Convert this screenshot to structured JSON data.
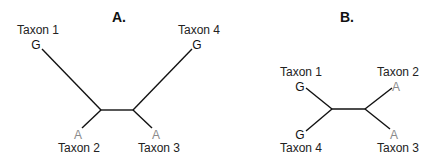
{
  "panels": [
    {
      "title": "A.",
      "taxa": [
        {
          "label": "Taxon 1",
          "state": "G"
        },
        {
          "label": "Taxon 4",
          "state": "G"
        },
        {
          "label": "Taxon 2",
          "state": "A"
        },
        {
          "label": "Taxon 3",
          "state": "A"
        }
      ]
    },
    {
      "title": "B.",
      "taxa": [
        {
          "label": "Taxon 1",
          "state": "G"
        },
        {
          "label": "Taxon 2",
          "state": "A"
        },
        {
          "label": "Taxon 4",
          "state": "G"
        },
        {
          "label": "Taxon 3",
          "state": "A"
        }
      ]
    }
  ],
  "colors": {
    "state_G": "#111111",
    "state_A": "#8a8a8a",
    "branch": "#111111"
  }
}
